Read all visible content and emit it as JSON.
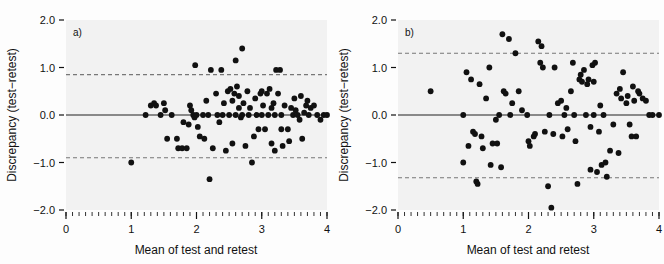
{
  "figure": {
    "background_color": "#fdfdfd",
    "plot_area_color": "#f2f2f2",
    "point_color": "#111111",
    "mean_line_color": "#666666",
    "limit_line_color": "#777777"
  },
  "chart_data": [
    {
      "type": "scatter",
      "title": "",
      "panel_label": "a)",
      "xlabel": "Mean of test and retest",
      "ylabel": "Discrepancy (test−retest)",
      "xlim": [
        0,
        4
      ],
      "ylim": [
        -2.0,
        2.0
      ],
      "xticks": [
        0,
        1,
        2,
        3,
        4
      ],
      "xtick_labels": [
        "0",
        "1",
        "2",
        "3",
        "4"
      ],
      "yticks": [
        -2.0,
        -1.0,
        0.0,
        1.0,
        2.0
      ],
      "ytick_labels": [
        "−2.0",
        "−1.0",
        "0.0",
        "1.0",
        "2.0"
      ],
      "minor_xticks_per_interval": 10,
      "grid": false,
      "legend": "none",
      "annotations": {
        "mean_line": 0.0,
        "upper_limit_of_agreement": 0.85,
        "lower_limit_of_agreement": -0.9
      },
      "points": [
        [
          1.0,
          -1.0
        ],
        [
          1.22,
          0.0
        ],
        [
          1.3,
          0.2
        ],
        [
          1.35,
          0.25
        ],
        [
          1.38,
          0.2
        ],
        [
          1.45,
          0.0
        ],
        [
          1.5,
          0.25
        ],
        [
          1.52,
          0.1
        ],
        [
          1.55,
          -0.5
        ],
        [
          1.62,
          0.0
        ],
        [
          1.7,
          -0.5
        ],
        [
          1.72,
          -0.7
        ],
        [
          1.78,
          -0.7
        ],
        [
          1.8,
          -0.15
        ],
        [
          1.85,
          -0.7
        ],
        [
          1.88,
          -0.2
        ],
        [
          1.9,
          0.2
        ],
        [
          1.92,
          0.1
        ],
        [
          1.95,
          0.0
        ],
        [
          1.97,
          -0.05
        ],
        [
          1.98,
          1.05
        ],
        [
          2.0,
          0.0
        ],
        [
          2.02,
          -0.25
        ],
        [
          2.05,
          -0.45
        ],
        [
          2.1,
          0.0
        ],
        [
          2.12,
          -0.5
        ],
        [
          2.15,
          0.3
        ],
        [
          2.18,
          0.0
        ],
        [
          2.2,
          -1.35
        ],
        [
          2.22,
          0.95
        ],
        [
          2.25,
          -0.7
        ],
        [
          2.3,
          0.45
        ],
        [
          2.32,
          0.0
        ],
        [
          2.35,
          -0.15
        ],
        [
          2.38,
          0.95
        ],
        [
          2.4,
          0.0
        ],
        [
          2.42,
          0.25
        ],
        [
          2.45,
          -0.75
        ],
        [
          2.48,
          0.5
        ],
        [
          2.5,
          0.0
        ],
        [
          2.52,
          0.55
        ],
        [
          2.55,
          0.3
        ],
        [
          2.55,
          -0.6
        ],
        [
          2.58,
          0.45
        ],
        [
          2.6,
          1.15
        ],
        [
          2.6,
          0.0
        ],
        [
          2.62,
          0.6
        ],
        [
          2.65,
          0.4
        ],
        [
          2.65,
          0.15
        ],
        [
          2.68,
          -0.05
        ],
        [
          2.7,
          1.4
        ],
        [
          2.7,
          0.0
        ],
        [
          2.72,
          0.25
        ],
        [
          2.75,
          -0.65
        ],
        [
          2.78,
          0.5
        ],
        [
          2.8,
          0.0
        ],
        [
          2.82,
          0.15
        ],
        [
          2.85,
          -1.0
        ],
        [
          2.88,
          -0.45
        ],
        [
          2.9,
          0.35
        ],
        [
          2.92,
          0.0
        ],
        [
          2.95,
          -0.3
        ],
        [
          2.98,
          0.45
        ],
        [
          3.0,
          0.0
        ],
        [
          3.0,
          0.5
        ],
        [
          3.02,
          0.2
        ],
        [
          3.05,
          -0.3
        ],
        [
          3.08,
          0.45
        ],
        [
          3.1,
          0.0
        ],
        [
          3.12,
          0.55
        ],
        [
          3.15,
          0.15
        ],
        [
          3.15,
          -0.6
        ],
        [
          3.18,
          0.25
        ],
        [
          3.2,
          0.0
        ],
        [
          3.2,
          -0.75
        ],
        [
          3.22,
          0.95
        ],
        [
          3.25,
          0.45
        ],
        [
          3.28,
          0.95
        ],
        [
          3.3,
          0.0
        ],
        [
          3.3,
          -0.3
        ],
        [
          3.32,
          -0.65
        ],
        [
          3.35,
          0.2
        ],
        [
          3.4,
          -0.3
        ],
        [
          3.42,
          -0.55
        ],
        [
          3.45,
          0.15
        ],
        [
          3.48,
          0.0
        ],
        [
          3.5,
          0.35
        ],
        [
          3.52,
          0.1
        ],
        [
          3.55,
          0.0
        ],
        [
          3.58,
          -0.1
        ],
        [
          3.6,
          0.4
        ],
        [
          3.62,
          -0.5
        ],
        [
          3.65,
          0.05
        ],
        [
          3.68,
          0.2
        ],
        [
          3.7,
          0.3
        ],
        [
          3.72,
          0.0
        ],
        [
          3.75,
          0.15
        ],
        [
          3.8,
          0.2
        ],
        [
          3.85,
          0.0
        ],
        [
          3.9,
          -0.1
        ],
        [
          3.95,
          0.0
        ],
        [
          4.0,
          0.0
        ]
      ]
    },
    {
      "type": "scatter",
      "title": "",
      "panel_label": "b)",
      "xlabel": "Mean of test and retest",
      "ylabel": "Discrepancy (test−retest)",
      "xlim": [
        0,
        4
      ],
      "ylim": [
        -2.0,
        2.0
      ],
      "xticks": [
        0,
        1,
        2,
        3,
        4
      ],
      "xtick_labels": [
        "0",
        "1",
        "2",
        "3",
        "4"
      ],
      "yticks": [
        -2.0,
        -1.0,
        0.0,
        1.0,
        2.0
      ],
      "ytick_labels": [
        "−2.0",
        "−1.0",
        "0.0",
        "1.0",
        "2.0"
      ],
      "minor_xticks_per_interval": 10,
      "grid": false,
      "legend": "none",
      "annotations": {
        "mean_line": 0.0,
        "upper_limit_of_agreement": 1.3,
        "lower_limit_of_agreement": -1.32
      },
      "points": [
        [
          0.5,
          0.5
        ],
        [
          1.0,
          0.0
        ],
        [
          1.0,
          -1.0
        ],
        [
          1.05,
          0.9
        ],
        [
          1.08,
          -0.65
        ],
        [
          1.12,
          0.75
        ],
        [
          1.15,
          -0.35
        ],
        [
          1.18,
          -0.4
        ],
        [
          1.2,
          -1.4
        ],
        [
          1.22,
          -1.45
        ],
        [
          1.25,
          0.65
        ],
        [
          1.28,
          -0.45
        ],
        [
          1.3,
          -0.7
        ],
        [
          1.35,
          0.35
        ],
        [
          1.4,
          1.0
        ],
        [
          1.42,
          -1.05
        ],
        [
          1.45,
          -0.6
        ],
        [
          1.5,
          -0.1
        ],
        [
          1.52,
          -0.6
        ],
        [
          1.55,
          0.0
        ],
        [
          1.58,
          -1.1
        ],
        [
          1.6,
          1.7
        ],
        [
          1.62,
          0.5
        ],
        [
          1.65,
          0.45
        ],
        [
          1.7,
          1.6
        ],
        [
          1.72,
          0.0
        ],
        [
          1.75,
          0.25
        ],
        [
          1.8,
          1.3
        ],
        [
          1.85,
          0.5
        ],
        [
          1.9,
          0.1
        ],
        [
          1.98,
          0.0
        ],
        [
          2.0,
          -0.55
        ],
        [
          2.02,
          -0.65
        ],
        [
          2.08,
          -0.45
        ],
        [
          2.1,
          -0.4
        ],
        [
          2.15,
          1.55
        ],
        [
          2.18,
          1.1
        ],
        [
          2.2,
          1.45
        ],
        [
          2.22,
          1.0
        ],
        [
          2.25,
          -0.35
        ],
        [
          2.3,
          -1.5
        ],
        [
          2.32,
          0.0
        ],
        [
          2.35,
          -1.95
        ],
        [
          2.38,
          -0.4
        ],
        [
          2.4,
          1.0
        ],
        [
          2.45,
          0.25
        ],
        [
          2.5,
          0.3
        ],
        [
          2.52,
          -0.45
        ],
        [
          2.55,
          0.0
        ],
        [
          2.58,
          0.15
        ],
        [
          2.6,
          -0.3
        ],
        [
          2.65,
          0.5
        ],
        [
          2.68,
          1.1
        ],
        [
          2.7,
          0.0
        ],
        [
          2.72,
          -0.55
        ],
        [
          2.75,
          -1.45
        ],
        [
          2.78,
          0.75
        ],
        [
          2.8,
          0.85
        ],
        [
          2.82,
          0.7
        ],
        [
          2.85,
          0.95
        ],
        [
          2.88,
          0.0
        ],
        [
          2.9,
          0.65
        ],
        [
          2.92,
          0.75
        ],
        [
          2.95,
          -0.25
        ],
        [
          2.95,
          -1.15
        ],
        [
          2.98,
          1.05
        ],
        [
          3.0,
          0.7
        ],
        [
          3.0,
          0.0
        ],
        [
          3.02,
          1.1
        ],
        [
          3.05,
          -1.2
        ],
        [
          3.08,
          -0.35
        ],
        [
          3.1,
          0.2
        ],
        [
          3.12,
          -1.05
        ],
        [
          3.15,
          0.0
        ],
        [
          3.18,
          -1.0
        ],
        [
          3.2,
          -1.3
        ],
        [
          3.25,
          -0.75
        ],
        [
          3.3,
          -0.2
        ],
        [
          3.35,
          0.45
        ],
        [
          3.38,
          -0.8
        ],
        [
          3.4,
          0.55
        ],
        [
          3.42,
          0.35
        ],
        [
          3.45,
          0.9
        ],
        [
          3.5,
          0.25
        ],
        [
          3.52,
          0.4
        ],
        [
          3.55,
          -0.2
        ],
        [
          3.58,
          -0.45
        ],
        [
          3.6,
          0.6
        ],
        [
          3.62,
          0.3
        ],
        [
          3.65,
          -0.45
        ],
        [
          3.68,
          0.5
        ],
        [
          3.7,
          0.45
        ],
        [
          3.75,
          0.35
        ],
        [
          3.8,
          0.3
        ],
        [
          3.85,
          0.0
        ],
        [
          3.9,
          0.0
        ],
        [
          4.0,
          0.0
        ]
      ]
    }
  ]
}
